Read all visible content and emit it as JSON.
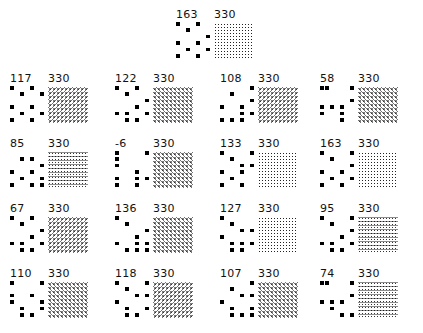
{
  "panels": [
    {
      "score": "163",
      "total": "330",
      "texture": "t0",
      "dots": [
        [
          0,
          0
        ],
        [
          2,
          0
        ],
        [
          1,
          1
        ],
        [
          3,
          2
        ],
        [
          2,
          3
        ],
        [
          0,
          3
        ],
        [
          1,
          4
        ],
        [
          3,
          4
        ],
        [
          0,
          5
        ],
        [
          2,
          5
        ]
      ]
    },
    {
      "score": "117",
      "total": "330",
      "texture": "t2",
      "dots": [
        [
          0,
          0
        ],
        [
          2,
          0
        ],
        [
          1,
          1
        ],
        [
          3,
          1
        ],
        [
          2,
          3
        ],
        [
          0,
          3
        ],
        [
          1,
          4
        ],
        [
          3,
          4
        ],
        [
          0,
          5
        ],
        [
          2,
          5
        ]
      ]
    },
    {
      "score": "122",
      "total": "330",
      "texture": "t1",
      "dots": [
        [
          0,
          0
        ],
        [
          2,
          0
        ],
        [
          1,
          1
        ],
        [
          3,
          2
        ],
        [
          2,
          3
        ],
        [
          3,
          4
        ],
        [
          0,
          4
        ],
        [
          1,
          4
        ],
        [
          1,
          5
        ],
        [
          2,
          5
        ]
      ]
    },
    {
      "score": "108",
      "total": "330",
      "texture": "t2",
      "dots": [
        [
          3,
          0
        ],
        [
          1,
          1
        ],
        [
          3,
          2
        ],
        [
          2,
          3
        ],
        [
          0,
          3
        ],
        [
          2,
          4
        ],
        [
          3,
          4
        ],
        [
          1,
          5
        ],
        [
          0,
          5
        ],
        [
          2,
          5
        ]
      ]
    },
    {
      "score": "58",
      "total": "330",
      "texture": "t1",
      "dots": [
        [
          0,
          0
        ],
        [
          0.5,
          0
        ],
        [
          3,
          0
        ],
        [
          3,
          2
        ],
        [
          2,
          3
        ],
        [
          0,
          3
        ],
        [
          1,
          3
        ],
        [
          2,
          4
        ],
        [
          0,
          4
        ],
        [
          2,
          5
        ]
      ]
    },
    {
      "score": "85",
      "total": "330",
      "texture": "t3",
      "dots": [
        [
          1,
          1
        ],
        [
          2,
          1
        ],
        [
          3,
          2
        ],
        [
          2,
          3
        ],
        [
          0,
          3
        ],
        [
          3,
          4
        ],
        [
          1,
          4
        ],
        [
          0,
          5
        ],
        [
          3,
          5
        ],
        [
          2,
          5
        ]
      ]
    },
    {
      "score": "-6",
      "total": "330",
      "texture": "t1",
      "dots": [
        [
          0,
          0
        ],
        [
          3,
          0
        ],
        [
          0,
          1
        ],
        [
          0,
          2
        ],
        [
          2,
          3
        ],
        [
          0,
          4
        ],
        [
          2,
          4
        ],
        [
          3,
          4
        ],
        [
          0,
          5
        ],
        [
          2,
          5
        ]
      ]
    },
    {
      "score": "133",
      "total": "330",
      "texture": "t0",
      "dots": [
        [
          0,
          0
        ],
        [
          1,
          1
        ],
        [
          3,
          0
        ],
        [
          2,
          2
        ],
        [
          3,
          2
        ],
        [
          2,
          3
        ],
        [
          0,
          3
        ],
        [
          1,
          4
        ],
        [
          0,
          5
        ],
        [
          2,
          5
        ]
      ]
    },
    {
      "score": "163",
      "total": "330",
      "texture": "t0",
      "dots": [
        [
          0,
          0
        ],
        [
          1,
          1
        ],
        [
          3,
          0
        ],
        [
          3,
          2
        ],
        [
          2,
          3
        ],
        [
          0,
          3
        ],
        [
          1,
          4
        ],
        [
          3,
          4
        ],
        [
          0,
          5
        ],
        [
          2,
          5
        ]
      ]
    },
    {
      "score": "67",
      "total": "330",
      "texture": "t2",
      "dots": [
        [
          0,
          0
        ],
        [
          2,
          0
        ],
        [
          1,
          1
        ],
        [
          3,
          2
        ],
        [
          2,
          3
        ],
        [
          0,
          4
        ],
        [
          1,
          4
        ],
        [
          3,
          4
        ],
        [
          1,
          5
        ],
        [
          2,
          5
        ]
      ]
    },
    {
      "score": "136",
      "total": "330",
      "texture": "t1",
      "dots": [
        [
          0,
          0
        ],
        [
          1,
          1
        ],
        [
          3,
          2
        ],
        [
          2,
          3
        ],
        [
          0,
          4
        ],
        [
          2,
          4
        ],
        [
          3,
          4
        ],
        [
          1,
          5
        ],
        [
          2,
          5
        ],
        [
          3,
          5
        ]
      ]
    },
    {
      "score": "127",
      "total": "330",
      "texture": "t0",
      "dots": [
        [
          0,
          0
        ],
        [
          1,
          1
        ],
        [
          2,
          2
        ],
        [
          3,
          2
        ],
        [
          0,
          3
        ],
        [
          2,
          4
        ],
        [
          1,
          4
        ],
        [
          3,
          4
        ],
        [
          1,
          5
        ],
        [
          2,
          5
        ]
      ]
    },
    {
      "score": "95",
      "total": "330",
      "texture": "t3",
      "dots": [
        [
          0,
          0
        ],
        [
          1,
          1
        ],
        [
          3,
          0
        ],
        [
          3,
          2
        ],
        [
          2,
          3
        ],
        [
          1,
          4
        ],
        [
          3,
          4
        ],
        [
          0,
          4
        ],
        [
          1,
          5
        ],
        [
          2,
          5
        ]
      ]
    },
    {
      "score": "110",
      "total": "330",
      "texture": "t1",
      "dots": [
        [
          0,
          0
        ],
        [
          3,
          0
        ],
        [
          0,
          2
        ],
        [
          2,
          2
        ],
        [
          3,
          3
        ],
        [
          0,
          3
        ],
        [
          1,
          4
        ],
        [
          3,
          4
        ],
        [
          1,
          5
        ],
        [
          2,
          5
        ]
      ]
    },
    {
      "score": "118",
      "total": "330",
      "texture": "t2",
      "dots": [
        [
          0,
          0
        ],
        [
          1,
          1
        ],
        [
          3,
          0
        ],
        [
          2,
          2
        ],
        [
          3,
          2
        ],
        [
          0,
          3
        ],
        [
          1,
          4
        ],
        [
          3,
          4
        ],
        [
          1,
          5
        ],
        [
          2,
          5
        ]
      ]
    },
    {
      "score": "107",
      "total": "330",
      "texture": "t1",
      "dots": [
        [
          1,
          1
        ],
        [
          3,
          0
        ],
        [
          2,
          2
        ],
        [
          3,
          2
        ],
        [
          0,
          3
        ],
        [
          1,
          4
        ],
        [
          3,
          4
        ],
        [
          1,
          5
        ],
        [
          2,
          5
        ],
        [
          3,
          5
        ]
      ]
    },
    {
      "score": "74",
      "total": "330",
      "texture": "t3",
      "dots": [
        [
          0,
          0
        ],
        [
          0.5,
          0
        ],
        [
          3,
          0
        ],
        [
          3,
          2
        ],
        [
          2,
          3
        ],
        [
          0,
          3
        ],
        [
          1,
          3
        ],
        [
          1,
          4
        ],
        [
          2,
          5
        ],
        [
          3,
          5
        ]
      ]
    }
  ],
  "layout": {
    "positions": [
      [
        176,
        9
      ],
      [
        10,
        73
      ],
      [
        115,
        73
      ],
      [
        220,
        73
      ],
      [
        320,
        73
      ],
      [
        10,
        138
      ],
      [
        115,
        138
      ],
      [
        220,
        138
      ],
      [
        320,
        138
      ],
      [
        10,
        203
      ],
      [
        115,
        203
      ],
      [
        220,
        203
      ],
      [
        320,
        203
      ],
      [
        10,
        268
      ],
      [
        115,
        268
      ],
      [
        220,
        268
      ],
      [
        320,
        268
      ]
    ]
  }
}
